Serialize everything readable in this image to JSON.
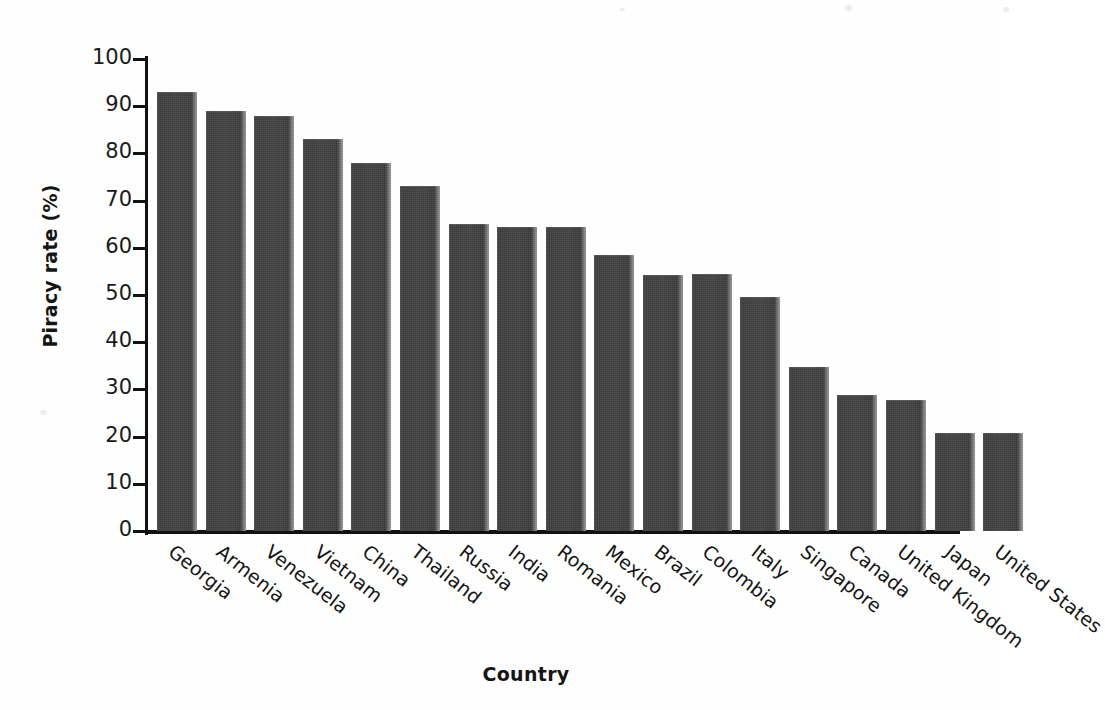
{
  "chart_data": {
    "type": "bar",
    "title": "",
    "xlabel": "Country",
    "ylabel": "Piracy rate (%)",
    "ylim": [
      0,
      100
    ],
    "ytick_step": 10,
    "yticks": [
      100,
      90,
      80,
      70,
      60,
      50,
      40,
      30,
      20,
      10,
      0
    ],
    "ytick_labels": [
      "100",
      "90",
      "80",
      "70",
      "60",
      "50",
      "40",
      "30",
      "20",
      "10",
      "0"
    ],
    "grid": false,
    "legend": null,
    "bar_color": "#444444",
    "categories": [
      "Georgia",
      "Armenia",
      "Venezuela",
      "Vietnam",
      "China",
      "Thailand",
      "Russia",
      "India",
      "Romania",
      "Mexico",
      "Brazil",
      "Colombia",
      "Italy",
      "Singapore",
      "Canada",
      "United Kingdom",
      "Japan",
      "United States"
    ],
    "values": [
      93,
      89,
      88,
      83,
      78,
      73,
      65.1,
      64.4,
      64.4,
      58.4,
      54.2,
      54.4,
      49.5,
      34.7,
      28.8,
      27.7,
      20.8,
      20.8
    ]
  }
}
